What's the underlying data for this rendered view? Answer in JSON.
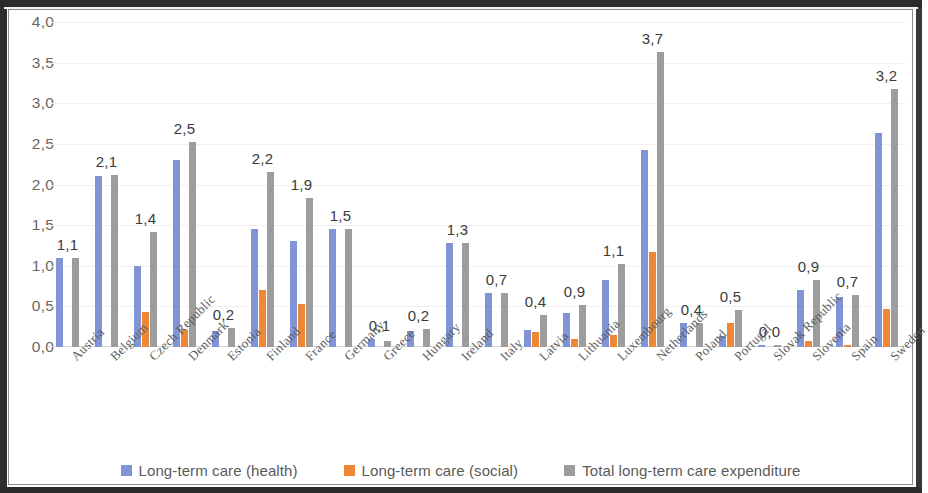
{
  "chart_data": {
    "type": "bar",
    "title": "",
    "subtitle": "",
    "xlabel": "",
    "ylabel": "",
    "ylim": [
      0,
      4.0
    ],
    "ytick_labels": [
      "0,0",
      "0,5",
      "1,0",
      "1,5",
      "2,0",
      "2,5",
      "3,0",
      "3,5",
      "4,0"
    ],
    "ytick_values": [
      0,
      0.5,
      1.0,
      1.5,
      2.0,
      2.5,
      3.0,
      3.5,
      4.0
    ],
    "grid": true,
    "legend_position": "bottom",
    "decimal_separator": ",",
    "data_label_series": "Total long-term care expenditure",
    "categories": [
      "Austria",
      "Belgium",
      "Czech Republic",
      "Denmark",
      "Estonia",
      "Finland",
      "France",
      "Germany",
      "Greece",
      "Hungary",
      "Ireland",
      "Italy",
      "Latvia",
      "Lithuania",
      "Luxembourg",
      "Netherlands",
      "Poland",
      "Portugal",
      "Slovak Republic",
      "Slovenia",
      "Spain",
      "Sweden"
    ],
    "series": [
      {
        "name": "Long-term care (health)",
        "color": "#8094d6",
        "values": [
          1.1,
          2.1,
          1.0,
          2.3,
          0.2,
          1.45,
          1.3,
          1.45,
          0.1,
          0.2,
          1.28,
          0.67,
          0.21,
          0.42,
          0.83,
          2.43,
          0.3,
          0.14,
          0.02,
          0.7,
          0.61,
          2.63
        ]
      },
      {
        "name": "Long-term care (social)",
        "color": "#ef8836",
        "values": [
          0.0,
          0.0,
          0.43,
          0.21,
          0.0,
          0.7,
          0.53,
          0.0,
          0.0,
          0.0,
          0.0,
          0.0,
          0.18,
          0.1,
          0.15,
          1.17,
          0.0,
          0.3,
          0.0,
          0.08,
          0.03,
          0.47
        ]
      },
      {
        "name": "Total long-term care expenditure",
        "color": "#9d9d9d",
        "values": [
          1.1,
          2.12,
          1.42,
          2.52,
          0.23,
          2.16,
          1.83,
          1.45,
          0.08,
          0.22,
          1.28,
          0.67,
          0.4,
          0.52,
          1.02,
          3.63,
          0.3,
          0.45,
          0.03,
          0.83,
          0.64,
          3.18
        ]
      }
    ],
    "data_labels": [
      "1,1",
      "2,1",
      "1,4",
      "2,5",
      "0,2",
      "2,2",
      "1,9",
      "1,5",
      "0,1",
      "0,2",
      "1,3",
      "0,7",
      "0,4",
      "0,9",
      "1,1",
      "3,7",
      "0,4",
      "0,5",
      "0,0",
      "0,9",
      "0,7",
      "3,2"
    ]
  },
  "legend": {
    "items": [
      {
        "label": "Long-term care (health)",
        "swatch": "health"
      },
      {
        "label": "Long-term care (social)",
        "swatch": "social"
      },
      {
        "label": "Total long-term care expenditure",
        "swatch": "total"
      }
    ]
  }
}
